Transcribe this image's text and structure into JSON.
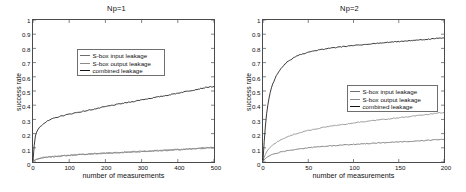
{
  "figure": {
    "background": "#ffffff",
    "series_colors": {
      "sbox_input": "#6e6e6e",
      "sbox_output": "#8a8a8a",
      "combined": "#141414"
    }
  },
  "chart_data": [
    {
      "type": "line",
      "panel": "left",
      "title": "Np=1",
      "xlabel": "number of measurements",
      "ylabel": "success rate",
      "xlim": [
        0,
        500
      ],
      "ylim": [
        0,
        1
      ],
      "xticks": [
        0,
        100,
        200,
        300,
        400,
        500
      ],
      "xticklabels": [
        "0",
        "100",
        "200",
        "300",
        "400",
        "500"
      ],
      "yticks": [
        0,
        0.1,
        0.2,
        0.3,
        0.4,
        0.5,
        0.6,
        0.7,
        0.8,
        0.9,
        1
      ],
      "yticklabels": [
        "0",
        "0.1",
        "0.2",
        "0.3",
        "0.4",
        "0.5",
        "0.6",
        "0.7",
        "0.8",
        "0.9",
        "1"
      ],
      "grid": false,
      "legend_position": "upper-left",
      "x": [
        0,
        5,
        10,
        15,
        20,
        25,
        30,
        40,
        50,
        60,
        70,
        80,
        90,
        100,
        120,
        140,
        160,
        180,
        200,
        225,
        250,
        275,
        300,
        325,
        350,
        375,
        400,
        425,
        450,
        470,
        490
      ],
      "series": [
        {
          "name": "S-box input leakage",
          "color": "#6e6e6e",
          "values": [
            0.005,
            0.012,
            0.018,
            0.022,
            0.025,
            0.028,
            0.03,
            0.033,
            0.036,
            0.038,
            0.04,
            0.042,
            0.044,
            0.046,
            0.05,
            0.053,
            0.056,
            0.058,
            0.061,
            0.064,
            0.067,
            0.07,
            0.073,
            0.076,
            0.079,
            0.082,
            0.085,
            0.089,
            0.093,
            0.096,
            0.1
          ]
        },
        {
          "name": "S-box output leakage",
          "color": "#8a8a8a",
          "values": [
            0.005,
            0.014,
            0.02,
            0.024,
            0.027,
            0.03,
            0.032,
            0.035,
            0.038,
            0.04,
            0.042,
            0.044,
            0.046,
            0.048,
            0.052,
            0.055,
            0.059,
            0.062,
            0.064,
            0.067,
            0.07,
            0.073,
            0.076,
            0.079,
            0.082,
            0.085,
            0.088,
            0.092,
            0.096,
            0.1,
            0.104
          ]
        },
        {
          "name": "combined leakage",
          "color": "#141414",
          "values": [
            0.01,
            0.17,
            0.21,
            0.235,
            0.25,
            0.262,
            0.272,
            0.288,
            0.3,
            0.31,
            0.318,
            0.325,
            0.331,
            0.337,
            0.348,
            0.357,
            0.368,
            0.378,
            0.39,
            0.402,
            0.414,
            0.425,
            0.438,
            0.449,
            0.46,
            0.472,
            0.485,
            0.498,
            0.51,
            0.521,
            0.53
          ]
        }
      ]
    },
    {
      "type": "line",
      "panel": "right",
      "title": "Np=2",
      "xlabel": "number of measurements",
      "ylabel": "success rate",
      "xlim": [
        0,
        200
      ],
      "ylim": [
        0,
        1
      ],
      "xticks": [
        0,
        50,
        100,
        150,
        200
      ],
      "xticklabels": [
        "0",
        "50",
        "100",
        "150",
        "200"
      ],
      "yticks": [
        0,
        0.1,
        0.2,
        0.3,
        0.4,
        0.5,
        0.6,
        0.7,
        0.8,
        0.9,
        1
      ],
      "yticklabels": [
        "0",
        "0.1",
        "0.2",
        "0.3",
        "0.4",
        "0.5",
        "0.6",
        "0.7",
        "0.8",
        "0.9",
        "1"
      ],
      "grid": false,
      "legend_position": "center-right",
      "x": [
        0,
        2,
        4,
        6,
        8,
        10,
        13,
        16,
        20,
        25,
        30,
        35,
        40,
        50,
        60,
        70,
        80,
        90,
        100,
        110,
        120,
        130,
        140,
        150,
        160,
        170,
        180,
        190,
        196
      ],
      "series": [
        {
          "name": "S-box input leakage",
          "color": "#6e6e6e",
          "values": [
            0.004,
            0.02,
            0.032,
            0.04,
            0.046,
            0.051,
            0.058,
            0.064,
            0.07,
            0.077,
            0.083,
            0.088,
            0.092,
            0.1,
            0.106,
            0.111,
            0.116,
            0.12,
            0.124,
            0.128,
            0.132,
            0.135,
            0.138,
            0.141,
            0.144,
            0.148,
            0.151,
            0.156,
            0.16
          ]
        },
        {
          "name": "S-box output leakage",
          "color": "#8a8a8a",
          "values": [
            0.006,
            0.045,
            0.072,
            0.09,
            0.104,
            0.115,
            0.13,
            0.143,
            0.157,
            0.172,
            0.185,
            0.196,
            0.206,
            0.222,
            0.235,
            0.247,
            0.257,
            0.266,
            0.275,
            0.283,
            0.29,
            0.297,
            0.304,
            0.311,
            0.318,
            0.326,
            0.334,
            0.343,
            0.348
          ]
        },
        {
          "name": "combined leakage",
          "color": "#141414",
          "values": [
            0.012,
            0.21,
            0.34,
            0.43,
            0.49,
            0.535,
            0.585,
            0.622,
            0.66,
            0.695,
            0.72,
            0.738,
            0.752,
            0.772,
            0.787,
            0.798,
            0.806,
            0.813,
            0.82,
            0.826,
            0.832,
            0.838,
            0.843,
            0.848,
            0.853,
            0.858,
            0.863,
            0.869,
            0.872
          ]
        }
      ]
    }
  ]
}
